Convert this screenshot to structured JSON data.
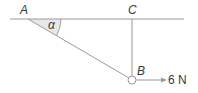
{
  "diagram": {
    "points": {
      "A": {
        "label": "A"
      },
      "B": {
        "label": "B"
      },
      "C": {
        "label": "C"
      }
    },
    "angle": {
      "label": "α",
      "at": "A"
    },
    "force": {
      "label": "6 N",
      "direction": "right",
      "at": "B"
    },
    "colors": {
      "line": "#9a9a9a",
      "text": "#3a3a3a",
      "angle_fill": "#e6e6e6"
    }
  }
}
